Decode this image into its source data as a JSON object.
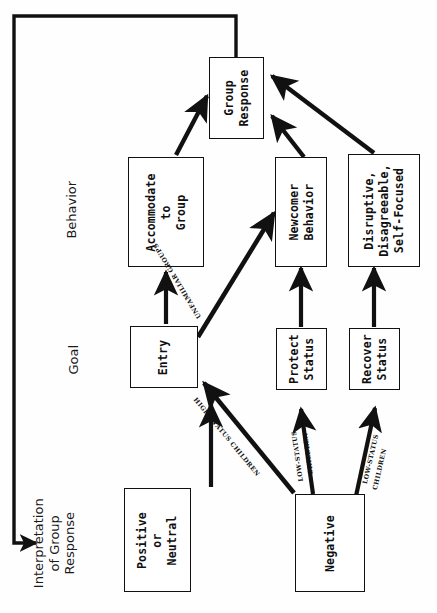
{
  "diagram": {
    "title_caption": "Interpretation of Group Response",
    "orientation": "rotated-90-ccw",
    "captions": [
      {
        "id": "interpretation",
        "lines": [
          "Interpretation",
          "of  Group",
          "Response"
        ]
      },
      {
        "id": "goal",
        "lines": [
          "Goal"
        ]
      },
      {
        "id": "behavior",
        "lines": [
          "Behavior"
        ]
      }
    ],
    "nodes": [
      {
        "id": "positive-or-neutral",
        "lines": [
          "Positive",
          "or",
          "Neutral"
        ]
      },
      {
        "id": "negative",
        "lines": [
          "Negative"
        ]
      },
      {
        "id": "entry",
        "lines": [
          "Entry"
        ]
      },
      {
        "id": "protect-status",
        "lines": [
          "Protect",
          "Status"
        ]
      },
      {
        "id": "recover-status",
        "lines": [
          "Recover",
          "Status"
        ]
      },
      {
        "id": "accommodate-to-group",
        "lines": [
          "Accommodate",
          "to",
          "Group"
        ]
      },
      {
        "id": "newcomer-behavior",
        "lines": [
          "Newcomer",
          "Behavior"
        ]
      },
      {
        "id": "disruptive-disagreeable",
        "lines": [
          "Disruptive,",
          "Disagreeable,",
          "Self-Focused"
        ]
      },
      {
        "id": "group-response",
        "lines": [
          "Group",
          "Response"
        ]
      }
    ],
    "edge_labels": [
      {
        "id": "unfamiliar-groups",
        "text": "UNFAMILIAR GROUPS"
      },
      {
        "id": "high-status-children",
        "text": "HIGH-STATUS CHILDREN"
      },
      {
        "id": "low-status-children-protect",
        "text": "LOW-STATUS"
      },
      {
        "id": "low-status-children-protect-2",
        "text": "CHILDREN"
      },
      {
        "id": "low-status-children-recover",
        "text": "LOW-STATUS"
      },
      {
        "id": "low-status-children-recover-2",
        "text": "CHILDREN"
      }
    ],
    "colors": {
      "stroke": "#111111",
      "box_fill": "#ffffff",
      "background": "#fefefe",
      "text": "#101010"
    }
  }
}
